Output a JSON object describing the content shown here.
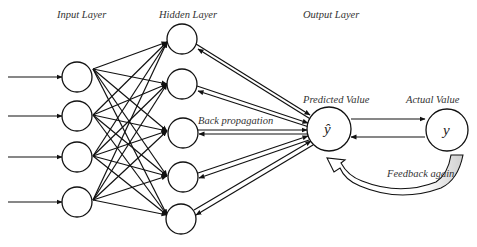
{
  "labels": {
    "input_layer": "Input Layer",
    "hidden_layer": "Hidden Layer",
    "output_layer": "Output Layer",
    "back_propagation": "Back propagation",
    "predicted_value": "Predicted Value",
    "actual_value": "Actual Value",
    "feedback_again": "Feedback again"
  },
  "nodes": {
    "predicted_symbol": "ŷ",
    "actual_symbol": "y",
    "input_count": 4,
    "hidden_count": 5
  },
  "colors": {
    "stroke": "#111111",
    "text": "#333333",
    "feedback_fill": "#d9d9d9"
  }
}
